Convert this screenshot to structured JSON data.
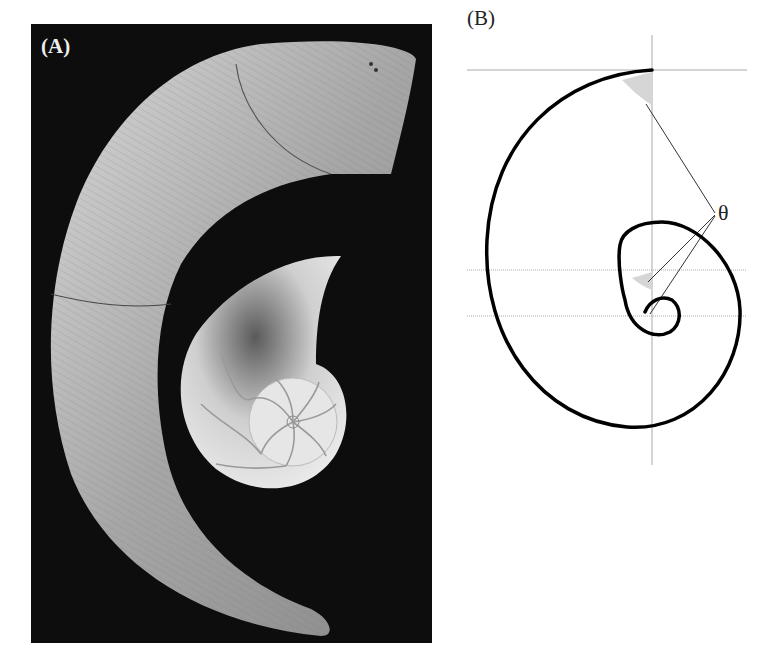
{
  "figure": {
    "panel_a": {
      "label": "(A)",
      "description": "Photograph of a curved ram's horn on a black background with a sectioned chambered nautilus shell nested inside the curve",
      "background_color": "#0d0d0d",
      "objects": [
        "ram-horn",
        "nautilus-shell-cross-section"
      ]
    },
    "panel_b": {
      "label": "(B)",
      "description": "Logarithmic (equiangular) spiral diagram with gray guide lines; the angle theta between the tangent and radius is shaded at three points, all labeled with a single theta",
      "angle_label": "θ",
      "spiral_color": "#000000",
      "guide_line_color": "#aaaaaa",
      "shade_color": "#d6d6d6"
    }
  }
}
